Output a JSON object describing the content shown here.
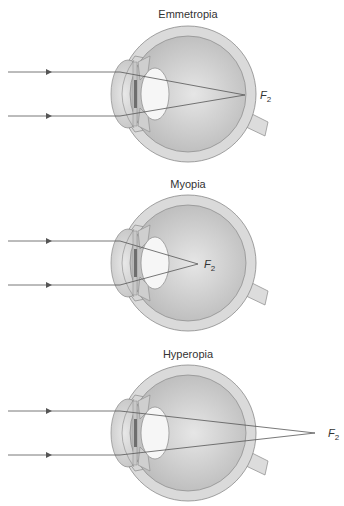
{
  "figure": {
    "panels": [
      {
        "title": "Emmetropia",
        "focal_label": "F",
        "focal_sub": "2",
        "description": "Parallel rays focus on retina"
      },
      {
        "title": "Myopia",
        "focal_label": "F",
        "focal_sub": "2",
        "description": "Parallel rays focus in front of retina"
      },
      {
        "title": "Hyperopia",
        "focal_label": "F",
        "focal_sub": "2",
        "description": "Parallel rays focus behind retina"
      }
    ]
  },
  "colors": {
    "sclera": "#d9d9d9",
    "vitreous": "#c4c4c4",
    "lens": "#f4f4f4",
    "ray": "#555555",
    "outline": "#7a7a7a"
  }
}
